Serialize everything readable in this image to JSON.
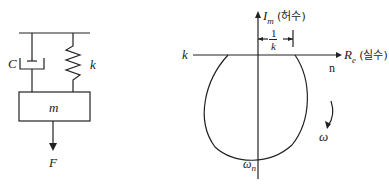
{
  "left_diagram": {
    "title": "mass-spring-damper system",
    "damper_label": "C",
    "spring_label": "k",
    "mass_label": "m",
    "force_label": "F"
  },
  "right_diagram": {
    "title": "polar (Nyquist) plot of compliance",
    "imag_axis": {
      "symbol": "I",
      "sub": "m",
      "korean": "(허수)"
    },
    "real_axis": {
      "symbol": "R",
      "sub": "e",
      "korean": "(실수)"
    },
    "offset_label": {
      "num": "1",
      "den": "k"
    },
    "left_k_label": "k",
    "n_label": "n",
    "omega_label": "ω",
    "omega_n_label": {
      "symbol": "ω",
      "sub": "n"
    }
  },
  "colors": {
    "line": "#222222",
    "background": "#ffffff"
  }
}
